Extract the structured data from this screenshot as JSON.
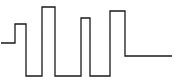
{
  "diagram": {
    "type": "waveform",
    "stroke_color": "#1a1a1a",
    "background": "#ffffff",
    "points": [
      [
        1,
        43
      ],
      [
        15,
        43
      ],
      [
        15,
        24
      ],
      [
        26,
        24
      ],
      [
        26,
        76
      ],
      [
        42,
        76
      ],
      [
        42,
        7
      ],
      [
        55,
        7
      ],
      [
        55,
        76
      ],
      [
        81,
        76
      ],
      [
        81,
        18
      ],
      [
        90,
        18
      ],
      [
        90,
        76
      ],
      [
        110,
        76
      ],
      [
        110,
        11
      ],
      [
        125,
        11
      ],
      [
        125,
        56
      ],
      [
        172,
        56
      ]
    ]
  }
}
